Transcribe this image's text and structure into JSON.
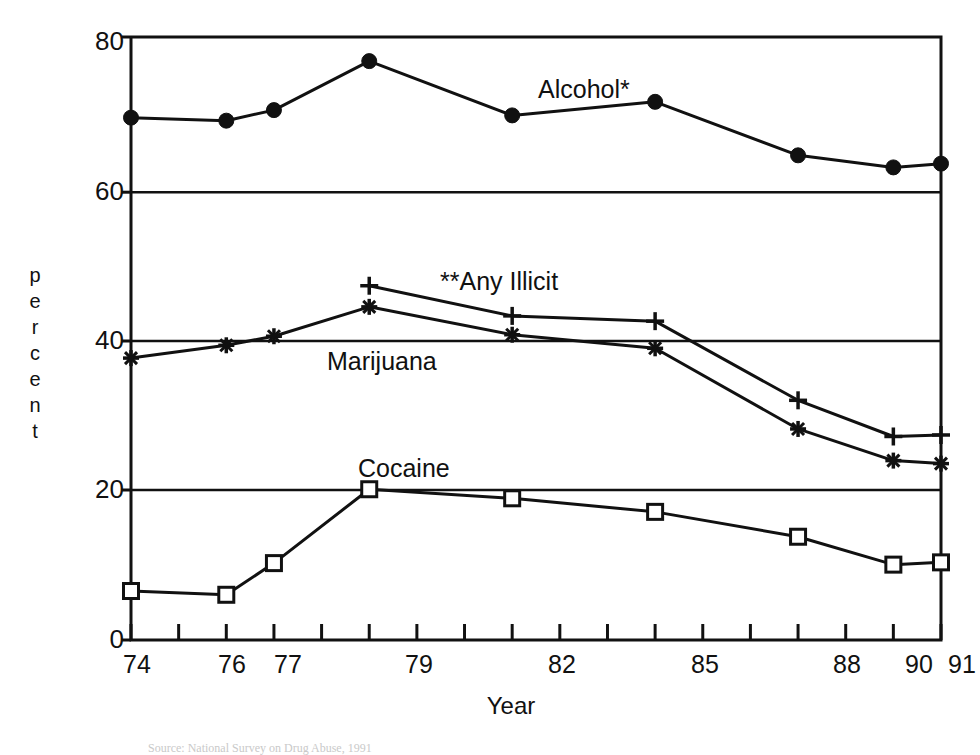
{
  "figure": {
    "background": "#ffffff",
    "ink": "#111111"
  },
  "axes": {
    "y_title_letters": [
      "p",
      "e",
      "r",
      "c",
      "e",
      "n",
      "t"
    ],
    "y_title": "percent",
    "x_title": "Year",
    "y_ticks": [
      "0",
      "20",
      "40",
      "60",
      "80"
    ],
    "x_ticks_labeled": [
      "74",
      "76",
      "77",
      "79",
      "82",
      "85",
      "88",
      "90",
      "91"
    ]
  },
  "annotations": [
    {
      "name": "alcohol",
      "text": "Alcohol*",
      "x": 538,
      "y": 76
    },
    {
      "name": "any-illicit",
      "text": "**Any Illicit",
      "x": 440,
      "y": 268
    },
    {
      "name": "marijuana",
      "text": "Marijuana",
      "x": 327,
      "y": 348
    },
    {
      "name": "cocaine",
      "text": "Cocaine",
      "x": 358,
      "y": 455
    }
  ],
  "footer": {
    "note": "Source:  National  Survey  on  Drug  Abuse,  1991"
  },
  "chart_data": {
    "type": "line",
    "title": "",
    "xlabel": "Year",
    "ylabel": "percent",
    "xlim": [
      74,
      91
    ],
    "ylim": [
      0,
      80
    ],
    "ytick_values": [
      0,
      20,
      40,
      60,
      80
    ],
    "grid": "horizontal-at-y-ticks",
    "legend": "inline-annotations",
    "series": [
      {
        "name": "Alcohol*",
        "marker": "filled-circle",
        "x": [
          74,
          76,
          77,
          79,
          82,
          85,
          88,
          90,
          91
        ],
        "values": [
          69.3,
          68.9,
          70.3,
          76.8,
          69.6,
          71.4,
          64.3,
          62.7,
          63.2
        ]
      },
      {
        "name": "**Any Illicit",
        "marker": "plus",
        "x": [
          79,
          82,
          85,
          88,
          90,
          91
        ],
        "values": [
          47.0,
          43.0,
          42.3,
          31.8,
          27.0,
          27.2
        ]
      },
      {
        "name": "Marijuana",
        "marker": "asterisk",
        "x": [
          74,
          76,
          77,
          79,
          82,
          85,
          88,
          90,
          91
        ],
        "values": [
          37.4,
          39.1,
          40.3,
          44.2,
          40.5,
          38.7,
          28.0,
          23.8,
          23.4
        ]
      },
      {
        "name": "Cocaine",
        "marker": "open-square",
        "x": [
          74,
          76,
          77,
          79,
          82,
          85,
          88,
          90,
          91
        ],
        "values": [
          6.5,
          6.0,
          10.2,
          20.0,
          18.8,
          17.0,
          13.7,
          10.0,
          10.3
        ]
      }
    ]
  }
}
